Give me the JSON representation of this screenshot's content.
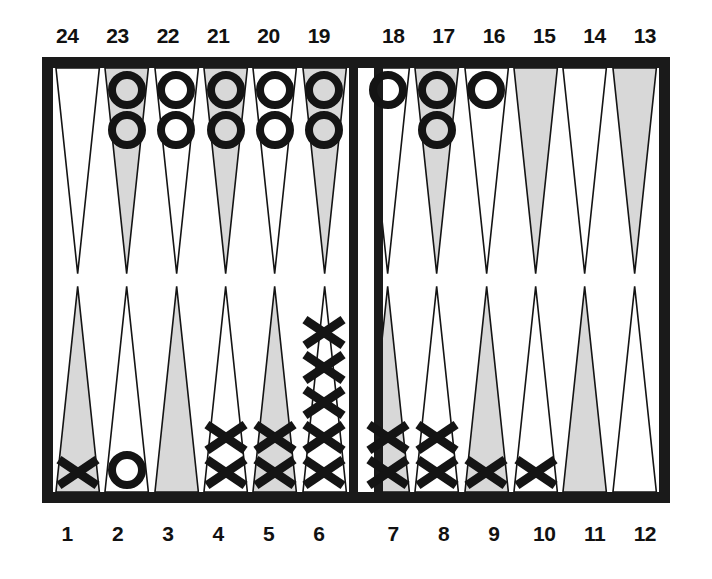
{
  "diagram": {
    "board_style": "printed line-art backgammon diagram"
  },
  "colors": {
    "frame": "#1a1a1a",
    "board_background": "#ffffff",
    "point_shaded_fill": "#d8d8d8",
    "point_plain_fill": "#ffffff",
    "point_outline": "#141414",
    "checker_outline": "#141414",
    "label_text": "#111111"
  },
  "labels": {
    "top_left": [
      "24",
      "23",
      "22",
      "21",
      "20",
      "19"
    ],
    "top_right": [
      "18",
      "17",
      "16",
      "15",
      "14",
      "13"
    ],
    "bottom_left": [
      "1",
      "2",
      "3",
      "4",
      "5",
      "6"
    ],
    "bottom_right": [
      "7",
      "8",
      "9",
      "10",
      "11",
      "12"
    ]
  },
  "board_data": {
    "type": "backgammon-position",
    "checker_glyphs": {
      "o": "circle-checker",
      "x": "cross-checker"
    },
    "quadrants": {
      "top_left": [
        {
          "point": "24",
          "shaded": false,
          "checker": null,
          "count": 0
        },
        {
          "point": "23",
          "shaded": true,
          "checker": "o",
          "count": 2
        },
        {
          "point": "22",
          "shaded": false,
          "checker": "o",
          "count": 2
        },
        {
          "point": "21",
          "shaded": true,
          "checker": "o",
          "count": 2
        },
        {
          "point": "20",
          "shaded": false,
          "checker": "o",
          "count": 2
        },
        {
          "point": "19",
          "shaded": true,
          "checker": "o",
          "count": 2
        }
      ],
      "top_right": [
        {
          "point": "18",
          "shaded": false,
          "checker": "o",
          "count": 1
        },
        {
          "point": "17",
          "shaded": true,
          "checker": "o",
          "count": 2
        },
        {
          "point": "16",
          "shaded": false,
          "checker": "o",
          "count": 1
        },
        {
          "point": "15",
          "shaded": true,
          "checker": null,
          "count": 0
        },
        {
          "point": "14",
          "shaded": false,
          "checker": null,
          "count": 0
        },
        {
          "point": "13",
          "shaded": true,
          "checker": null,
          "count": 0
        }
      ],
      "bottom_left": [
        {
          "point": "1",
          "shaded": true,
          "checker": "x",
          "count": 1
        },
        {
          "point": "2",
          "shaded": false,
          "checker": "o",
          "count": 1
        },
        {
          "point": "3",
          "shaded": true,
          "checker": null,
          "count": 0
        },
        {
          "point": "4",
          "shaded": false,
          "checker": "x",
          "count": 2
        },
        {
          "point": "5",
          "shaded": true,
          "checker": "x",
          "count": 2
        },
        {
          "point": "6",
          "shaded": false,
          "checker": "x",
          "count": 5
        }
      ],
      "bottom_right": [
        {
          "point": "7",
          "shaded": true,
          "checker": "x",
          "count": 2
        },
        {
          "point": "8",
          "shaded": false,
          "checker": "x",
          "count": 2
        },
        {
          "point": "9",
          "shaded": true,
          "checker": "x",
          "count": 1
        },
        {
          "point": "10",
          "shaded": false,
          "checker": "x",
          "count": 1
        },
        {
          "point": "11",
          "shaded": true,
          "checker": null,
          "count": 0
        },
        {
          "point": "12",
          "shaded": false,
          "checker": null,
          "count": 0
        }
      ]
    }
  }
}
